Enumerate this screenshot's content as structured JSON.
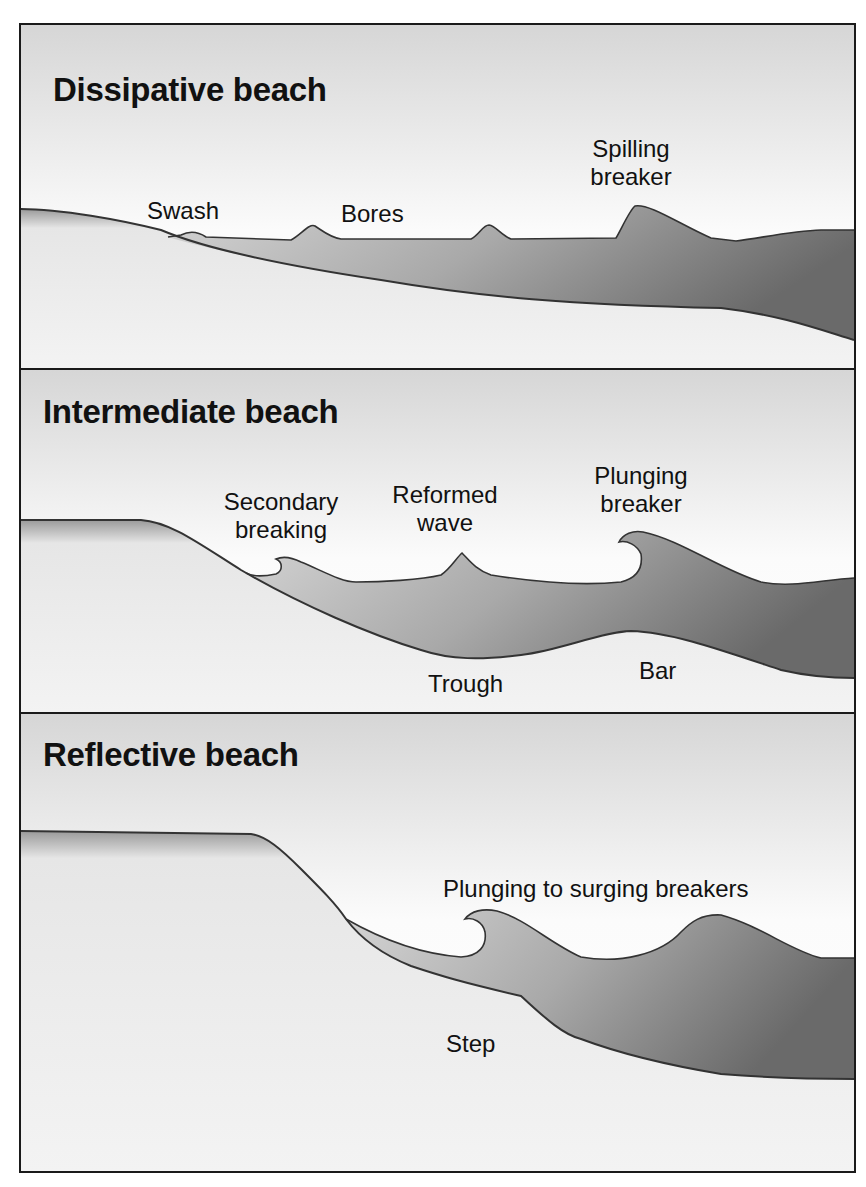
{
  "figure": {
    "colors": {
      "sky_top": "#d9d9d9",
      "sky_bottom": "#ffffff",
      "sand": "#f0f0f0",
      "water_light": "#c8c8c8",
      "water_dark": "#6e6e6e",
      "outline": "#333333",
      "border": "#1a1a1a"
    },
    "panels": [
      {
        "title": "Dissipative beach",
        "labels": {
          "swash": "Swash",
          "bores": "Bores",
          "spilling_line1": "Spilling",
          "spilling_line2": "breaker"
        }
      },
      {
        "title": "Intermediate beach",
        "labels": {
          "secondary_line1": "Secondary",
          "secondary_line2": "breaking",
          "reformed_line1": "Reformed",
          "reformed_line2": "wave",
          "plunging_line1": "Plunging",
          "plunging_line2": "breaker",
          "trough": "Trough",
          "bar": "Bar"
        }
      },
      {
        "title": "Reflective beach",
        "labels": {
          "plunging_surging": "Plunging to surging breakers",
          "step": "Step"
        }
      }
    ]
  }
}
